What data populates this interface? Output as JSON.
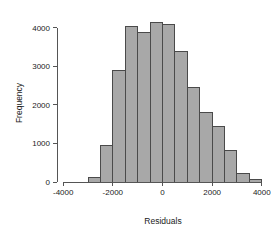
{
  "chart_data": {
    "type": "bar",
    "title": "",
    "subtitle": "",
    "xlabel": "Residuals",
    "ylabel": "Frequency",
    "xlim": [
      -4250,
      4250
    ],
    "ylim": [
      0,
      4300
    ],
    "x_ticks": [
      -4000,
      -2000,
      0,
      2000,
      4000
    ],
    "x_tick_labels": [
      "-4000",
      "-2000",
      "0",
      "2000",
      "4000"
    ],
    "y_ticks": [
      0,
      1000,
      2000,
      3000,
      4000
    ],
    "y_tick_labels": [
      "0",
      "1000",
      "2000",
      "3000",
      "4000"
    ],
    "grid": false,
    "legend": null,
    "bin_width": 500,
    "bin_edges": [
      -3000,
      -2500,
      -2000,
      -1500,
      -1000,
      -500,
      0,
      500,
      1000,
      1500,
      2000,
      2500,
      3000,
      3500,
      4000,
      4500
    ],
    "bin_centers": [
      -2750,
      -2250,
      -1750,
      -1250,
      -750,
      -250,
      250,
      750,
      1250,
      1750,
      2250,
      2750,
      3250,
      3750,
      4250
    ],
    "categories": [
      "-3000 to -2500",
      "-2500 to -2000",
      "-2000 to -1500",
      "-1500 to -1000",
      "-1000 to -500",
      "-500 to 0",
      "0 to 500",
      "500 to 1000",
      "1000 to 1500",
      "1500 to 2000",
      "2000 to 2500",
      "2500 to 3000",
      "3000 to 3500",
      "3500 to 4000",
      "4000 to 4500"
    ],
    "values": [
      110,
      950,
      2900,
      4020,
      3880,
      4140,
      4090,
      3390,
      2450,
      1790,
      1450,
      810,
      230,
      60,
      0
    ],
    "bar_fill_color": "#a8a8a8",
    "bar_border_color": "#4a4a4a",
    "axis_color": "#555555",
    "background_color": "#ffffff"
  }
}
